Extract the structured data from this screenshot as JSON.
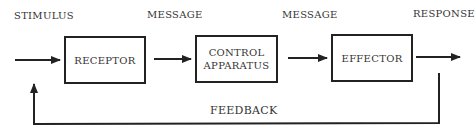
{
  "diagram": {
    "labels": {
      "stimulus": "STIMULUS",
      "message_1": "MESSAGE",
      "message_2": "MESSAGE",
      "response": "RESPONSE",
      "feedback": "FEEDBACK"
    },
    "boxes": [
      {
        "id": "receptor",
        "line1": "RECEPTOR",
        "line2": ""
      },
      {
        "id": "control",
        "line1": "CONTROL",
        "line2": "APPARATUS"
      },
      {
        "id": "effector",
        "line1": "EFFECTOR",
        "line2": ""
      }
    ],
    "edges": [
      {
        "from": "stimulus",
        "to": "receptor"
      },
      {
        "from": "receptor",
        "to": "control",
        "label": "MESSAGE"
      },
      {
        "from": "control",
        "to": "effector",
        "label": "MESSAGE"
      },
      {
        "from": "effector",
        "to": "response"
      },
      {
        "from": "response",
        "to": "stimulus-input",
        "label": "FEEDBACK"
      }
    ],
    "colors": {
      "line": "#222222",
      "text": "#333333",
      "background": "#ffffff"
    }
  }
}
